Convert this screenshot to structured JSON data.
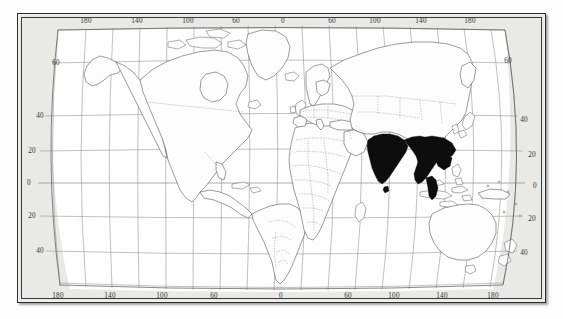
{
  "figure": {
    "kind": "world-distribution-map",
    "projection_style": "curved-graticule world map",
    "background_color": "#e9e9e6",
    "land_color": "#fdfdfd",
    "coastline_color": "#4a4a4a",
    "graticule_color": "#8e8e8e",
    "highlight_color": "#0d0d0d",
    "frame_color": "#2a2a2a"
  },
  "axes": {
    "longitude_label_values": [
      "180",
      "140",
      "100",
      "60",
      "0",
      "60",
      "100",
      "140",
      "180"
    ],
    "latitude_label_values": [
      "60",
      "40",
      "20",
      "0",
      "20",
      "40",
      "60"
    ],
    "graticule_interval_degrees": "20"
  },
  "top_labels": [
    {
      "text": "180",
      "x": 86,
      "y": 21
    },
    {
      "text": "140",
      "x": 137,
      "y": 21
    },
    {
      "text": "100",
      "x": 188,
      "y": 21
    },
    {
      "text": "60",
      "x": 236,
      "y": 21
    },
    {
      "text": "0",
      "x": 283,
      "y": 21
    },
    {
      "text": "60",
      "x": 332,
      "y": 21
    },
    {
      "text": "100",
      "x": 375,
      "y": 21
    },
    {
      "text": "140",
      "x": 421,
      "y": 21
    },
    {
      "text": "180",
      "x": 470,
      "y": 21
    }
  ],
  "bottom_labels": [
    {
      "text": "180",
      "x": 58,
      "y": 296
    },
    {
      "text": "140",
      "x": 110,
      "y": 296
    },
    {
      "text": "100",
      "x": 162,
      "y": 296
    },
    {
      "text": "60",
      "x": 214,
      "y": 296
    },
    {
      "text": "0",
      "x": 281,
      "y": 296
    },
    {
      "text": "60",
      "x": 348,
      "y": 296
    },
    {
      "text": "100",
      "x": 394,
      "y": 296
    },
    {
      "text": "140",
      "x": 442,
      "y": 296
    },
    {
      "text": "180",
      "x": 493,
      "y": 296
    }
  ],
  "left_labels": [
    {
      "text": "60",
      "x": 56,
      "y": 63
    },
    {
      "text": "40",
      "x": 40,
      "y": 116
    },
    {
      "text": "20",
      "x": 32,
      "y": 151
    },
    {
      "text": "0",
      "x": 29,
      "y": 183
    },
    {
      "text": "20",
      "x": 32,
      "y": 216
    },
    {
      "text": "40",
      "x": 40,
      "y": 251
    }
  ],
  "right_labels": [
    {
      "text": "60",
      "x": 508,
      "y": 61
    },
    {
      "text": "40",
      "x": 524,
      "y": 120
    },
    {
      "text": "20",
      "x": 532,
      "y": 155
    },
    {
      "text": "0",
      "x": 535,
      "y": 186
    },
    {
      "text": "20",
      "x": 532,
      "y": 219
    },
    {
      "text": "40",
      "x": 524,
      "y": 253
    }
  ],
  "highlighted_region": {
    "name": "indian-subcontinent-and-southeast-asia",
    "description": "Solid black shaded distribution range covering India, Pakistan border area, Nepal, Bangladesh, Sri Lanka, Myanmar, Thailand, Laos, Cambodia, Vietnam, Malay Peninsula and southern China",
    "fill": "#0d0d0d"
  },
  "landmasses": [
    "north-america",
    "south-america",
    "greenland",
    "europe",
    "africa",
    "asia",
    "australia",
    "new-zealand",
    "japan",
    "indonesia",
    "philippines",
    "madagascar",
    "british-isles",
    "iceland"
  ]
}
